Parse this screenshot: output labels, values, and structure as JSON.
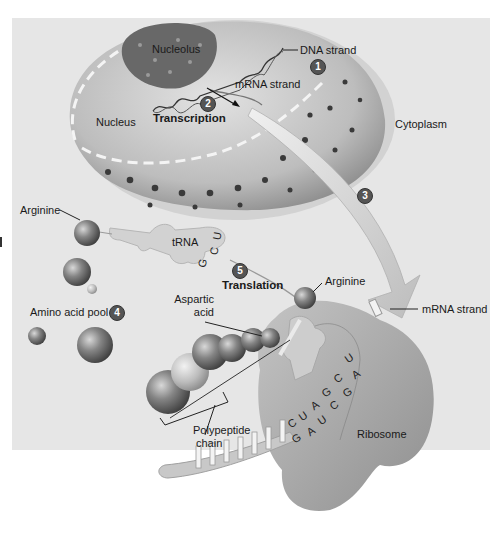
{
  "figure": {
    "colors": {
      "background": "#ffffff",
      "panel": "#e6e6e6",
      "nucleus": "#c9c9c9",
      "nucleolus": "#6e6e6e",
      "ribosome": "#a8a8a8",
      "amino_acid": "#7a7a7a",
      "step_badge": "#555555"
    },
    "regions": {
      "nucleolus": "Nucleolus",
      "nucleus": "Nucleus",
      "cytoplasm": "Cytoplasm",
      "ribosome": "Ribosome"
    },
    "labels": {
      "dna_strand": "DNA strand",
      "mrna_strand_nucleus": "mRNA strand",
      "transcription": "Transcription",
      "arginine_pool": "Arginine",
      "trna": "tRNA",
      "translation": "Translation",
      "arginine_ribosome": "Arginine",
      "aspartic_acid_line1": "Aspartic",
      "aspartic_acid_line2": "acid",
      "amino_acid_pool": "Amino acid pool",
      "mrna_strand_cytoplasm": "mRNA strand",
      "polypeptide_line1": "Polypeptide",
      "polypeptide_line2": "chain"
    },
    "steps": [
      "1",
      "2",
      "3",
      "4",
      "5"
    ],
    "trna_anticodon": [
      "G",
      "C",
      "U"
    ],
    "codons": {
      "mrna_row": [
        "C",
        "U",
        "A",
        "G",
        "C",
        "A"
      ],
      "mrna_row_top": [
        "U"
      ],
      "trna_row": [
        "G",
        "A",
        "U",
        "C",
        "G"
      ]
    }
  }
}
